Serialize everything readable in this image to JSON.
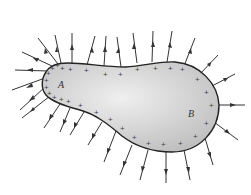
{
  "diagram": {
    "type": "charged-conductor-field-lines",
    "labels": {
      "point_a": "A",
      "point_b": "B"
    },
    "charge_symbol": "+",
    "colors": {
      "outline": "#222222",
      "fill_light": "#eeeeee",
      "fill_dark": "#bdbdbd",
      "arrow": "#333333",
      "charge": "#444444"
    }
  }
}
